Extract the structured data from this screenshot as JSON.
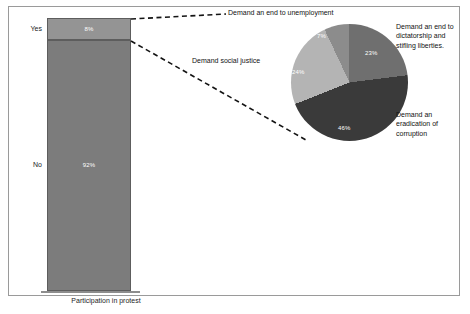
{
  "chart_data": [
    {
      "type": "bar",
      "title": "",
      "xlabel": "Participation in protest",
      "ylabel": "",
      "categories": [
        "Yes",
        "No"
      ],
      "values": [
        8,
        92
      ],
      "value_labels": [
        "8%",
        "92%"
      ],
      "stacked": true,
      "orientation": "vertical",
      "ylim": [
        0,
        100
      ],
      "grid": false,
      "legend": "none",
      "colors": [
        "#949494",
        "#7c7c7c"
      ]
    },
    {
      "type": "pie",
      "title": "",
      "note": "Breakdown of the 'Yes' participation segment",
      "categories": [
        "Demand an end to dictatorship and stifling liberties.",
        "Demand an eradication of corruption",
        "Demand social justice",
        "Demand an end to unemployment"
      ],
      "values": [
        23,
        46,
        24,
        7
      ],
      "value_labels": [
        "23%",
        "46%",
        "24%",
        "7%"
      ],
      "colors": [
        "#6f6f6f",
        "#3a3a3a",
        "#b4b4b4",
        "#8c8c8c"
      ],
      "legend": "callout-labels",
      "start_angle_deg": 0
    }
  ],
  "bar_chart": {
    "axis_title": "Participation in protest",
    "segments": [
      {
        "category": "Yes",
        "label": "Yes",
        "value_label": "8%"
      },
      {
        "category": "No",
        "label": "No",
        "value_label": "92%"
      }
    ]
  },
  "pie_chart": {
    "slices": [
      {
        "name": "dictatorship",
        "label": "Demand an end to dictatorship and stifling liberties.",
        "value_label": "23%"
      },
      {
        "name": "corruption",
        "label": "Demand an eradication of corruption",
        "value_label": "46%"
      },
      {
        "name": "justice",
        "label": "Demand social justice",
        "value_label": "24%"
      },
      {
        "name": "unemployment",
        "label": "Demand an end to unemployment",
        "value_label": "7%"
      }
    ]
  },
  "colors": {
    "bar_yes": "#949494",
    "bar_no": "#7c7c7c",
    "pie_dictatorship": "#6f6f6f",
    "pie_corruption": "#3a3a3a",
    "pie_justice": "#b4b4b4",
    "pie_unemployment": "#8c8c8c",
    "frame": "#9a9a9a",
    "text": "#111111"
  }
}
